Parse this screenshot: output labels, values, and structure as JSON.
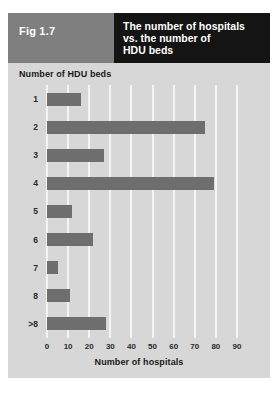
{
  "figure": {
    "label": "Fig 1.7",
    "title_lines": [
      "The number of hospitals",
      "vs. the number of",
      "HDU beds"
    ],
    "colors": {
      "panel_background": "#d7d7d7",
      "label_block": "#7f7f7f",
      "title_block": "#141414",
      "bar": "#6e6e6e",
      "gridline": "#f4f4f4",
      "title_text": "#ffffff",
      "axis_text": "#1a1a1a"
    }
  },
  "chart_data": {
    "type": "bar",
    "orientation": "horizontal",
    "title": "The number of hospitals vs. the number of HDU beds",
    "xlabel": "Number of hospitals",
    "ylabel": "Number of HDU beds",
    "categories": [
      "1",
      "2",
      "3",
      "4",
      "5",
      "6",
      "7",
      "8",
      ">8"
    ],
    "values": [
      16,
      75,
      27,
      79,
      12,
      22,
      5,
      11,
      28
    ],
    "xlim": [
      0,
      90
    ],
    "xticks": [
      0,
      10,
      20,
      30,
      40,
      50,
      60,
      70,
      80,
      90
    ],
    "xtick_labels": [
      "0",
      "10",
      "20",
      "30",
      "40",
      "50",
      "60",
      "70",
      "80",
      "90"
    ],
    "grid": true,
    "grid_axis": "x",
    "legend": false,
    "series": [
      {
        "name": "Number of hospitals",
        "values": [
          16,
          75,
          27,
          79,
          12,
          22,
          5,
          11,
          28
        ]
      }
    ]
  }
}
